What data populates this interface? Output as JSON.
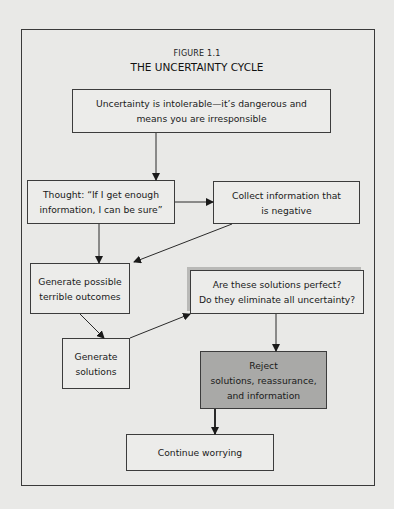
{
  "figure": {
    "label": "FIGURE 1.1",
    "title": "THE UNCERTAINTY CYCLE"
  },
  "nodes": {
    "intolerable": "Uncertainty is intolerable—it’s dangerous and\nmeans you are irresponsible",
    "thought": "Thought: “If I get enough\ninformation, I can be sure”",
    "collect": "Collect information that\nis negative",
    "outcomes": "Generate possible\nterrible outcomes",
    "perfect": "Are these solutions perfect?\nDo they eliminate all uncertainty?",
    "solutions": "Generate\nsolutions",
    "reject": "Reject\nsolutions, reassurance,\nand information",
    "continue": "Continue worrying"
  },
  "colors": {
    "background": "#e9e9e7",
    "box_fill": "#ececea",
    "highlight_fill": "#a9a9a7",
    "line": "#2a2a2a"
  },
  "edges": [
    {
      "from": "intolerable",
      "to": "thought"
    },
    {
      "from": "thought",
      "to": "collect"
    },
    {
      "from": "thought",
      "to": "outcomes"
    },
    {
      "from": "collect",
      "to": "outcomes"
    },
    {
      "from": "outcomes",
      "to": "solutions"
    },
    {
      "from": "solutions",
      "to": "perfect"
    },
    {
      "from": "perfect",
      "to": "reject"
    },
    {
      "from": "reject",
      "to": "continue"
    }
  ]
}
